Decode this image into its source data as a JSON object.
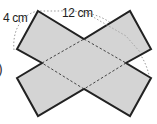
{
  "figure": {
    "labels": {
      "width_label": "4 cm",
      "length_label": "12 cm",
      "partial_marker": ")"
    },
    "colors": {
      "fill": "#d4d4d4",
      "outline": "#222222",
      "fold_lines": "#444444",
      "dimension_arc": "#9a9a9a"
    },
    "shape": {
      "outline_points": "38,11 84,39 130,11 151,49 126,63 151,78 130,116 84,89 38,116 17,78 42,63 17,49",
      "fold_lines": [
        {
          "x1": 84,
          "y1": 39,
          "x2": 126,
          "y2": 63
        },
        {
          "x1": 126,
          "y1": 63,
          "x2": 84,
          "y2": 89
        },
        {
          "x1": 84,
          "y1": 89,
          "x2": 42,
          "y2": 63
        },
        {
          "x1": 42,
          "y1": 63,
          "x2": 84,
          "y2": 39
        }
      ]
    }
  }
}
